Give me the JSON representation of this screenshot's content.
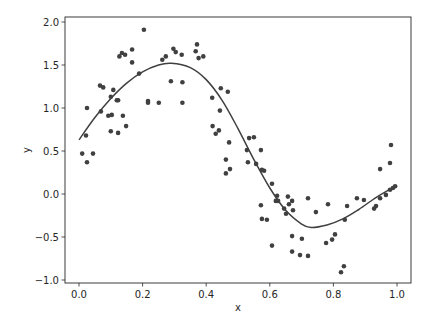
{
  "chart_data": {
    "type": "scatter",
    "title": "",
    "xlabel": "x",
    "ylabel": "y",
    "xlim": [
      -0.05,
      1.05
    ],
    "ylim": [
      -1.05,
      2.05
    ],
    "grid": false,
    "legend": null,
    "x_ticks": [
      0.0,
      0.2,
      0.4,
      0.6,
      0.8,
      1.0
    ],
    "x_tick_labels": [
      "0.0",
      "0.2",
      "0.4",
      "0.6",
      "0.8",
      "1.0"
    ],
    "y_ticks": [
      -1.0,
      -0.5,
      0.0,
      0.5,
      1.0,
      1.5,
      2.0
    ],
    "y_tick_labels": [
      "−1.0",
      "−0.5",
      "0.0",
      "0.5",
      "1.0",
      "1.5",
      "2.0"
    ],
    "series": [
      {
        "name": "samples",
        "kind": "scatter",
        "color": "#404040",
        "points": [
          [
            0.01,
            0.47
          ],
          [
            0.025,
            0.37
          ],
          [
            0.044,
            0.47
          ],
          [
            0.025,
            1.0
          ],
          [
            0.022,
            0.68
          ],
          [
            0.066,
            1.26
          ],
          [
            0.076,
            1.24
          ],
          [
            0.069,
            0.96
          ],
          [
            0.092,
            0.91
          ],
          [
            0.103,
            0.92
          ],
          [
            0.1,
            1.13
          ],
          [
            0.108,
            1.21
          ],
          [
            0.1,
            0.73
          ],
          [
            0.119,
            1.09
          ],
          [
            0.123,
            1.09
          ],
          [
            0.123,
            0.71
          ],
          [
            0.138,
            0.91
          ],
          [
            0.148,
            0.79
          ],
          [
            0.127,
            1.6
          ],
          [
            0.135,
            1.64
          ],
          [
            0.145,
            1.62
          ],
          [
            0.167,
            1.68
          ],
          [
            0.167,
            1.53
          ],
          [
            0.189,
            1.4
          ],
          [
            0.204,
            1.91
          ],
          [
            0.217,
            1.08
          ],
          [
            0.217,
            1.06
          ],
          [
            0.251,
            1.06
          ],
          [
            0.262,
            1.56
          ],
          [
            0.273,
            1.6
          ],
          [
            0.289,
            1.31
          ],
          [
            0.297,
            1.69
          ],
          [
            0.304,
            1.65
          ],
          [
            0.323,
            1.62
          ],
          [
            0.325,
            1.3
          ],
          [
            0.325,
            1.06
          ],
          [
            0.367,
            1.66
          ],
          [
            0.371,
            1.74
          ],
          [
            0.376,
            1.58
          ],
          [
            0.391,
            1.6
          ],
          [
            0.419,
            1.12
          ],
          [
            0.42,
            0.79
          ],
          [
            0.43,
            0.7
          ],
          [
            0.44,
            0.74
          ],
          [
            0.443,
            0.97
          ],
          [
            0.446,
            1.23
          ],
          [
            0.468,
            1.19
          ],
          [
            0.472,
            0.6
          ],
          [
            0.462,
            0.4
          ],
          [
            0.475,
            0.29
          ],
          [
            0.462,
            0.24
          ],
          [
            0.535,
            0.65
          ],
          [
            0.55,
            0.66
          ],
          [
            0.528,
            0.51
          ],
          [
            0.572,
            0.51
          ],
          [
            0.531,
            0.37
          ],
          [
            0.557,
            0.35
          ],
          [
            0.575,
            0.28
          ],
          [
            0.582,
            0.27
          ],
          [
            0.607,
            0.12
          ],
          [
            0.623,
            -0.02
          ],
          [
            0.619,
            -0.08
          ],
          [
            0.626,
            -0.08
          ],
          [
            0.657,
            -0.03
          ],
          [
            0.66,
            -0.12
          ],
          [
            0.67,
            -0.08
          ],
          [
            0.645,
            -0.17
          ],
          [
            0.651,
            -0.23
          ],
          [
            0.673,
            -0.19
          ],
          [
            0.572,
            -0.13
          ],
          [
            0.575,
            -0.29
          ],
          [
            0.591,
            -0.3
          ],
          [
            0.607,
            -0.6
          ],
          [
            0.67,
            -0.49
          ],
          [
            0.701,
            -0.52
          ],
          [
            0.67,
            -0.67
          ],
          [
            0.695,
            -0.71
          ],
          [
            0.72,
            -0.72
          ],
          [
            0.72,
            -0.05
          ],
          [
            0.745,
            -0.21
          ],
          [
            0.783,
            -0.12
          ],
          [
            0.777,
            -0.57
          ],
          [
            0.796,
            -0.53
          ],
          [
            0.805,
            -0.47
          ],
          [
            0.824,
            -0.91
          ],
          [
            0.833,
            -0.84
          ],
          [
            0.836,
            -0.3
          ],
          [
            0.843,
            -0.14
          ],
          [
            0.874,
            -0.05
          ],
          [
            0.896,
            -0.07
          ],
          [
            0.928,
            -0.17
          ],
          [
            0.934,
            -0.14
          ],
          [
            0.947,
            -0.05
          ],
          [
            0.965,
            -0.01
          ],
          [
            0.978,
            0.05
          ],
          [
            0.987,
            0.07
          ],
          [
            0.994,
            0.09
          ],
          [
            0.947,
            0.29
          ],
          [
            0.978,
            0.36
          ],
          [
            0.981,
            0.57
          ]
        ]
      },
      {
        "name": "fit",
        "kind": "line",
        "color": "#404040",
        "points": [
          [
            0.0,
            0.63
          ],
          [
            0.05,
            0.89
          ],
          [
            0.1,
            1.11
          ],
          [
            0.15,
            1.29
          ],
          [
            0.2,
            1.42
          ],
          [
            0.25,
            1.5
          ],
          [
            0.29,
            1.52
          ],
          [
            0.35,
            1.47
          ],
          [
            0.4,
            1.33
          ],
          [
            0.45,
            1.09
          ],
          [
            0.5,
            0.76
          ],
          [
            0.55,
            0.4
          ],
          [
            0.6,
            0.07
          ],
          [
            0.65,
            -0.19
          ],
          [
            0.7,
            -0.35
          ],
          [
            0.73,
            -0.39
          ],
          [
            0.78,
            -0.36
          ],
          [
            0.83,
            -0.29
          ],
          [
            0.88,
            -0.18
          ],
          [
            0.93,
            -0.05
          ],
          [
            0.97,
            0.04
          ],
          [
            1.0,
            0.1
          ]
        ]
      }
    ]
  },
  "plot": {
    "xlabel": "x",
    "ylabel": "y",
    "x_tick_labels": [
      "0.0",
      "0.2",
      "0.4",
      "0.6",
      "0.8",
      "1.0"
    ],
    "y_tick_labels": [
      "−1.0",
      "−0.5",
      "0.0",
      "0.5",
      "1.0",
      "1.5",
      "2.0"
    ]
  }
}
